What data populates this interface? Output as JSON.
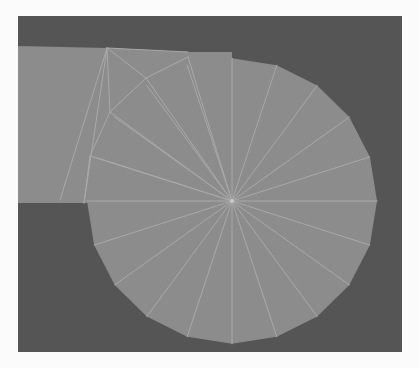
{
  "scene": {
    "type": "triangulated-mesh-render",
    "description": "Wireframe-overlaid flat-shaded mesh: a disc fan joined to a rectangular slab, on a dark viewport",
    "colors": {
      "page_background": "#fbfbfb",
      "viewport_background": "#555555",
      "mesh_fill": "#8c8c8c",
      "edge_color": "#a9a9a9",
      "hub_color": "#c8c8c8"
    },
    "viewport": {
      "x": 18,
      "y": 16,
      "width": 384,
      "height": 336
    },
    "disc": {
      "center": [
        232,
        201
      ],
      "radius": 145,
      "segments": 20
    },
    "slab": {
      "outline": [
        [
          18,
          46
        ],
        [
          107,
          48
        ],
        [
          188,
          52
        ],
        [
          232,
          52
        ],
        [
          232,
          201
        ],
        [
          84,
          203
        ],
        [
          18,
          203
        ]
      ]
    },
    "extra_vertices": [
      [
        107,
        48
      ],
      [
        146,
        78
      ],
      [
        110,
        112
      ],
      [
        90,
        156
      ],
      [
        188,
        57
      ],
      [
        60,
        200
      ]
    ],
    "extra_edges": [
      [
        [
          107,
          48
        ],
        [
          60,
          200
        ]
      ],
      [
        [
          107,
          48
        ],
        [
          84,
          203
        ]
      ],
      [
        [
          107,
          48
        ],
        [
          110,
          112
        ]
      ],
      [
        [
          107,
          48
        ],
        [
          146,
          78
        ]
      ],
      [
        [
          146,
          78
        ],
        [
          188,
          57
        ]
      ],
      [
        [
          146,
          78
        ],
        [
          110,
          112
        ]
      ],
      [
        [
          146,
          78
        ],
        [
          232,
          201
        ]
      ],
      [
        [
          110,
          112
        ],
        [
          90,
          156
        ]
      ],
      [
        [
          110,
          112
        ],
        [
          232,
          201
        ]
      ],
      [
        [
          90,
          156
        ],
        [
          232,
          201
        ]
      ],
      [
        [
          90,
          156
        ],
        [
          84,
          203
        ]
      ],
      [
        [
          188,
          57
        ],
        [
          232,
          201
        ]
      ],
      [
        [
          107,
          48
        ],
        [
          188,
          52
        ]
      ]
    ]
  }
}
